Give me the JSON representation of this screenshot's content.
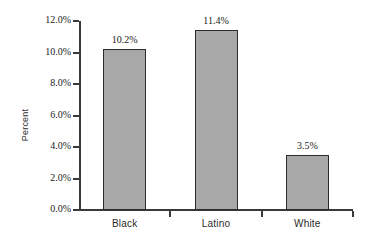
{
  "chart_data": {
    "type": "bar",
    "title": "",
    "xlabel": "",
    "ylabel": "Percent",
    "categories": [
      "Black",
      "Latino",
      "White"
    ],
    "values": [
      10.2,
      11.4,
      3.5
    ],
    "value_labels": [
      "10.2%",
      "11.4%",
      "3.5%"
    ],
    "ylim": [
      0.0,
      12.0
    ],
    "ytick_values": [
      0.0,
      2.0,
      4.0,
      6.0,
      8.0,
      10.0,
      12.0
    ],
    "ytick_labels": [
      "0.0%",
      "2.0%",
      "4.0%",
      "6.0%",
      "8.0%",
      "10.0%",
      "12.0%"
    ],
    "grid": false,
    "legend": null,
    "bar_fill_color": "#a8a8a8",
    "bar_border_color": "#2a2a2a",
    "axis_color": "#3a3a3a",
    "background_color": "#ffffff"
  }
}
